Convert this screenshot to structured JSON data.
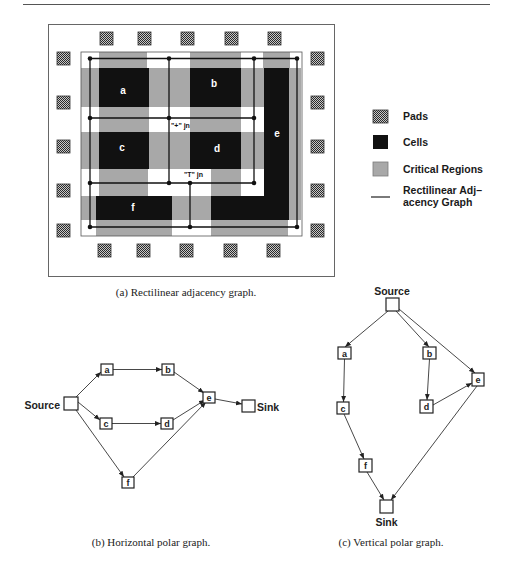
{
  "colors": {
    "cell": "#111111",
    "critical_region": "#a8a8a8",
    "pad_dark": "#2a2a2a",
    "pad_light": "#c8c8c8",
    "graph_line": "#111111"
  },
  "figure_a": {
    "caption": "(a) Rectilinear adjacency graph.",
    "cells": [
      {
        "id": "a",
        "label": "a"
      },
      {
        "id": "b",
        "label": "b"
      },
      {
        "id": "c",
        "label": "c"
      },
      {
        "id": "d",
        "label": "d"
      },
      {
        "id": "e",
        "label": "e"
      },
      {
        "id": "f",
        "label": "f"
      }
    ],
    "junctions": {
      "plus": "\"+\" jn",
      "tee": "\"T\" jn"
    },
    "pads": {
      "top": 5,
      "bottom": 5,
      "left": 5,
      "right": 5
    },
    "legend": [
      {
        "key": "pads",
        "label": "Pads"
      },
      {
        "key": "cells",
        "label": "Cells"
      },
      {
        "key": "critical_regions",
        "label": "Critical Regions"
      },
      {
        "key": "adjacency_graph",
        "label_line1": "Rectilinear Adj–",
        "label_line2": "acency Graph"
      }
    ]
  },
  "figure_b": {
    "caption": "(b) Horizontal polar graph.",
    "source_label": "Source",
    "sink_label": "Sink",
    "nodes": [
      "a",
      "b",
      "c",
      "d",
      "e",
      "f"
    ],
    "edges": [
      [
        "Source",
        "a"
      ],
      [
        "Source",
        "c"
      ],
      [
        "Source",
        "f"
      ],
      [
        "a",
        "b"
      ],
      [
        "c",
        "d"
      ],
      [
        "b",
        "e"
      ],
      [
        "d",
        "e"
      ],
      [
        "f",
        "e"
      ],
      [
        "e",
        "Sink"
      ]
    ]
  },
  "figure_c": {
    "caption": "(c) Vertical polar graph.",
    "source_label": "Source",
    "sink_label": "Sink",
    "nodes": [
      "a",
      "b",
      "c",
      "d",
      "e",
      "f"
    ],
    "edges": [
      [
        "Source",
        "a"
      ],
      [
        "Source",
        "b"
      ],
      [
        "Source",
        "e"
      ],
      [
        "a",
        "c"
      ],
      [
        "b",
        "d"
      ],
      [
        "d",
        "e"
      ],
      [
        "c",
        "f"
      ],
      [
        "f",
        "Sink"
      ],
      [
        "e",
        "Sink"
      ]
    ]
  }
}
